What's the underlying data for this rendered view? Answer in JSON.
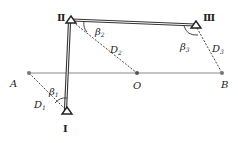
{
  "diagram": {
    "colors": {
      "ink": "#222222",
      "baseline": "#888888",
      "traverse": "#444444",
      "point": "#777777"
    },
    "stations": [
      {
        "id": "I",
        "label": "Ⅰ",
        "x": 67,
        "y": 112
      },
      {
        "id": "II",
        "label": "Ⅱ",
        "x": 71,
        "y": 21
      },
      {
        "id": "III",
        "label": "Ⅲ",
        "x": 196,
        "y": 26
      }
    ],
    "points": [
      {
        "id": "A",
        "label": "A",
        "x": 29,
        "y": 73
      },
      {
        "id": "O",
        "label": "O",
        "x": 137,
        "y": 73
      },
      {
        "id": "B",
        "label": "B",
        "x": 222,
        "y": 73
      }
    ],
    "angles": [
      {
        "label": "β",
        "sub": "1"
      },
      {
        "label": "β",
        "sub": "2"
      },
      {
        "label": "β",
        "sub": "3"
      }
    ],
    "distances": [
      {
        "label": "D",
        "sub": "1"
      },
      {
        "label": "D",
        "sub": "2"
      },
      {
        "label": "D",
        "sub": "3"
      }
    ]
  }
}
